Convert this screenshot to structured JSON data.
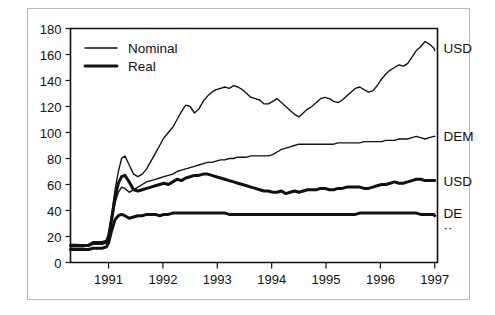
{
  "figure": {
    "background_color": "#ffffff",
    "ink_color": "#111111",
    "frame_color": "#b9b9b9"
  },
  "legend": {
    "position": "top-left-inside",
    "entries": [
      {
        "label": "Nominal",
        "style": "thin"
      },
      {
        "label": "Real",
        "style": "thick"
      }
    ]
  },
  "right_labels": [
    {
      "text": "USD",
      "value": 165
    },
    {
      "text": "DEM",
      "value": 97
    },
    {
      "text": "USD",
      "value": 63
    },
    {
      "text": "DE",
      "value": 38
    },
    {
      "text": "··",
      "value": 27
    }
  ],
  "chart_data": {
    "type": "line",
    "title": "",
    "xlabel": "",
    "ylabel": "",
    "xlim": [
      1990.3,
      1997.05
    ],
    "ylim": [
      0,
      180
    ],
    "yticks": [
      0,
      20,
      40,
      60,
      80,
      100,
      120,
      140,
      160,
      180
    ],
    "xticks": [
      1991,
      1992,
      1993,
      1994,
      1995,
      1996,
      1997
    ],
    "grid": false,
    "legend_position": "upper left",
    "series": [
      {
        "name": "USD nominal",
        "style": "thin",
        "end_label": "USD",
        "x": [
          1990.3,
          1990.42,
          1990.54,
          1990.63,
          1990.72,
          1990.8,
          1990.88,
          1990.96,
          1991.0,
          1991.06,
          1991.12,
          1991.18,
          1991.24,
          1991.3,
          1991.38,
          1991.46,
          1991.54,
          1991.62,
          1991.7,
          1991.78,
          1991.86,
          1991.94,
          1992.02,
          1992.1,
          1992.18,
          1992.26,
          1992.34,
          1992.42,
          1992.5,
          1992.58,
          1992.66,
          1992.74,
          1992.82,
          1992.9,
          1992.98,
          1993.06,
          1993.14,
          1993.22,
          1993.3,
          1993.38,
          1993.46,
          1993.54,
          1993.62,
          1993.7,
          1993.78,
          1993.86,
          1993.94,
          1994.02,
          1994.1,
          1994.18,
          1994.26,
          1994.34,
          1994.42,
          1994.5,
          1994.58,
          1994.66,
          1994.74,
          1994.82,
          1994.9,
          1994.98,
          1995.06,
          1995.14,
          1995.22,
          1995.3,
          1995.38,
          1995.46,
          1995.54,
          1995.62,
          1995.7,
          1995.78,
          1995.86,
          1995.94,
          1996.02,
          1996.1,
          1996.18,
          1996.26,
          1996.34,
          1996.42,
          1996.5,
          1996.58,
          1996.66,
          1996.74,
          1996.82,
          1996.9,
          1996.98,
          1997.0
        ],
        "y": [
          14,
          14,
          13,
          14,
          16,
          16,
          16,
          17,
          22,
          38,
          56,
          70,
          80,
          82,
          75,
          68,
          66,
          68,
          72,
          78,
          84,
          90,
          96,
          100,
          104,
          110,
          116,
          121,
          120,
          115,
          118,
          124,
          128,
          131,
          133,
          134,
          135,
          134,
          136,
          135,
          133,
          130,
          127,
          126,
          125,
          122,
          122,
          124,
          126,
          123,
          120,
          117,
          114,
          112,
          115,
          118,
          120,
          123,
          126,
          127,
          126,
          124,
          123,
          125,
          128,
          131,
          134,
          135,
          133,
          131,
          132,
          136,
          141,
          145,
          148,
          150,
          152,
          151,
          153,
          158,
          163,
          166,
          170,
          168,
          165,
          163
        ]
      },
      {
        "name": "DEM nominal",
        "style": "thin",
        "end_label": "DEM",
        "x": [
          1990.3,
          1990.42,
          1990.54,
          1990.63,
          1990.72,
          1990.8,
          1990.88,
          1990.96,
          1991.0,
          1991.06,
          1991.12,
          1991.18,
          1991.24,
          1991.3,
          1991.38,
          1991.46,
          1991.54,
          1991.62,
          1991.7,
          1991.78,
          1991.86,
          1991.94,
          1992.02,
          1992.1,
          1992.18,
          1992.26,
          1992.34,
          1992.42,
          1992.5,
          1992.58,
          1992.66,
          1992.74,
          1992.82,
          1992.9,
          1992.98,
          1993.06,
          1993.14,
          1993.22,
          1993.3,
          1993.38,
          1993.46,
          1993.54,
          1993.62,
          1993.7,
          1993.78,
          1993.86,
          1993.94,
          1994.02,
          1994.1,
          1994.18,
          1994.26,
          1994.34,
          1994.42,
          1994.5,
          1994.58,
          1994.66,
          1994.74,
          1994.82,
          1994.9,
          1994.98,
          1995.06,
          1995.14,
          1995.22,
          1995.3,
          1995.38,
          1995.46,
          1995.54,
          1995.62,
          1995.7,
          1995.78,
          1995.86,
          1995.94,
          1996.02,
          1996.1,
          1996.18,
          1996.26,
          1996.34,
          1996.42,
          1996.5,
          1996.58,
          1996.66,
          1996.74,
          1996.82,
          1996.9,
          1996.98,
          1997.0
        ],
        "y": [
          12,
          12,
          12,
          13,
          14,
          14,
          14,
          15,
          19,
          32,
          46,
          54,
          58,
          57,
          54,
          56,
          58,
          60,
          62,
          63,
          64,
          65,
          66,
          67,
          68,
          70,
          71,
          72,
          73,
          74,
          75,
          76,
          77,
          77,
          78,
          79,
          79,
          80,
          80,
          81,
          81,
          81,
          82,
          82,
          82,
          82,
          82,
          83,
          85,
          87,
          88,
          89,
          90,
          91,
          91,
          91,
          91,
          91,
          91,
          91,
          91,
          91,
          92,
          92,
          92,
          92,
          92,
          92,
          93,
          93,
          93,
          93,
          93,
          94,
          94,
          94,
          95,
          95,
          95,
          96,
          97,
          96,
          95,
          96,
          97,
          97
        ]
      },
      {
        "name": "USD real",
        "style": "thick",
        "end_label": "USD",
        "x": [
          1990.3,
          1990.42,
          1990.54,
          1990.63,
          1990.72,
          1990.8,
          1990.88,
          1990.96,
          1991.0,
          1991.06,
          1991.12,
          1991.18,
          1991.24,
          1991.3,
          1991.38,
          1991.46,
          1991.54,
          1991.62,
          1991.7,
          1991.78,
          1991.86,
          1991.94,
          1992.02,
          1992.1,
          1992.18,
          1992.26,
          1992.34,
          1992.42,
          1992.5,
          1992.58,
          1992.66,
          1992.74,
          1992.82,
          1992.9,
          1992.98,
          1993.06,
          1993.14,
          1993.22,
          1993.3,
          1993.38,
          1993.46,
          1993.54,
          1993.62,
          1993.7,
          1993.78,
          1993.86,
          1993.94,
          1994.02,
          1994.1,
          1994.18,
          1994.26,
          1994.34,
          1994.42,
          1994.5,
          1994.58,
          1994.66,
          1994.74,
          1994.82,
          1994.9,
          1994.98,
          1995.06,
          1995.14,
          1995.22,
          1995.3,
          1995.38,
          1995.46,
          1995.54,
          1995.62,
          1995.7,
          1995.78,
          1995.86,
          1995.94,
          1996.02,
          1996.1,
          1996.18,
          1996.26,
          1996.34,
          1996.42,
          1996.5,
          1996.58,
          1996.66,
          1996.74,
          1996.82,
          1996.9,
          1996.98,
          1997.0
        ],
        "y": [
          13,
          13,
          13,
          13,
          15,
          15,
          15,
          16,
          20,
          34,
          50,
          61,
          66,
          67,
          62,
          56,
          55,
          56,
          57,
          58,
          59,
          60,
          61,
          60,
          62,
          64,
          63,
          65,
          66,
          67,
          67,
          68,
          68,
          67,
          66,
          65,
          64,
          63,
          62,
          61,
          60,
          59,
          58,
          57,
          56,
          55,
          55,
          54,
          54,
          55,
          53,
          54,
          55,
          54,
          55,
          56,
          56,
          56,
          57,
          57,
          56,
          56,
          57,
          57,
          58,
          58,
          58,
          58,
          57,
          57,
          58,
          59,
          60,
          60,
          61,
          62,
          61,
          61,
          62,
          63,
          64,
          64,
          63,
          63,
          63,
          63
        ]
      },
      {
        "name": "DEM real",
        "style": "thick",
        "end_label": "DE",
        "x": [
          1990.3,
          1990.42,
          1990.54,
          1990.63,
          1990.72,
          1990.8,
          1990.88,
          1990.96,
          1991.0,
          1991.06,
          1991.12,
          1991.18,
          1991.24,
          1991.3,
          1991.38,
          1991.46,
          1991.54,
          1991.62,
          1991.7,
          1991.78,
          1991.86,
          1991.94,
          1992.02,
          1992.1,
          1992.18,
          1992.26,
          1992.34,
          1992.42,
          1992.5,
          1992.58,
          1992.66,
          1992.74,
          1992.82,
          1992.9,
          1992.98,
          1993.06,
          1993.14,
          1993.22,
          1993.3,
          1993.38,
          1993.46,
          1993.54,
          1993.62,
          1993.7,
          1993.78,
          1993.86,
          1993.94,
          1994.02,
          1994.1,
          1994.18,
          1994.26,
          1994.34,
          1994.42,
          1994.5,
          1994.58,
          1994.66,
          1994.74,
          1994.82,
          1994.9,
          1994.98,
          1995.06,
          1995.14,
          1995.22,
          1995.3,
          1995.38,
          1995.46,
          1995.54,
          1995.62,
          1995.7,
          1995.78,
          1995.86,
          1995.94,
          1996.02,
          1996.1,
          1996.18,
          1996.26,
          1996.34,
          1996.42,
          1996.5,
          1996.58,
          1996.66,
          1996.74,
          1996.82,
          1996.9,
          1996.98,
          1997.0
        ],
        "y": [
          10,
          10,
          10,
          10,
          11,
          11,
          11,
          12,
          15,
          25,
          33,
          36,
          37,
          36,
          34,
          35,
          36,
          36,
          37,
          37,
          37,
          36,
          37,
          37,
          38,
          38,
          38,
          38,
          38,
          38,
          38,
          38,
          38,
          38,
          38,
          38,
          38,
          37,
          37,
          37,
          37,
          37,
          37,
          37,
          37,
          37,
          37,
          37,
          37,
          37,
          37,
          37,
          37,
          37,
          37,
          37,
          37,
          37,
          37,
          37,
          37,
          37,
          37,
          37,
          37,
          37,
          37,
          38,
          38,
          38,
          38,
          38,
          38,
          38,
          38,
          38,
          38,
          38,
          38,
          38,
          38,
          37,
          37,
          37,
          37,
          36
        ]
      }
    ]
  }
}
